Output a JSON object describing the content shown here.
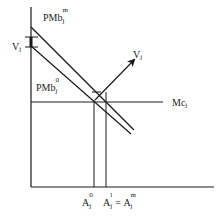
{
  "diagram": {
    "type": "economics-supply-demand",
    "colors": {
      "line": "#1a1a1a",
      "background": "#ffffff"
    },
    "labels": {
      "pmb_m": {
        "base": "PMb",
        "sup": "m",
        "sub": "j"
      },
      "pmb_0": {
        "base": "PMb",
        "sup": "0",
        "sub": "j"
      },
      "v_left": {
        "base": "V",
        "sub": "j"
      },
      "v_arrow": {
        "base": "V",
        "sub": "j"
      },
      "mc": {
        "base": "Mc",
        "sub": "j"
      },
      "a0": {
        "base": "A",
        "sup": "0",
        "sub": "j"
      },
      "a1_am": {
        "base1": "A",
        "sup1": "l",
        "sub1": "j",
        "eq": "=",
        "base2": "A",
        "sup2": "m",
        "sub2": "j"
      }
    },
    "elements": {
      "y_axis": {
        "x": 31,
        "y1": 7,
        "y2": 187
      },
      "x_axis": {
        "y": 187,
        "x1": 31,
        "x2": 214
      },
      "pmb_m_line": {
        "x1": 31,
        "y1": 27,
        "x2": 134,
        "y2": 130
      },
      "pmb_0_line": {
        "x1": 31,
        "y1": 46,
        "x2": 131,
        "y2": 134
      },
      "mc_line": {
        "y": 102,
        "x1": 31,
        "x2": 163
      },
      "v_arrow": {
        "x1": 95,
        "y1": 100,
        "x2": 135,
        "y2": 59
      },
      "a0_drop": {
        "x": 94,
        "y1": 100,
        "y2": 187
      },
      "a1_drop": {
        "x": 106,
        "y1": 92,
        "y2": 187
      }
    }
  }
}
